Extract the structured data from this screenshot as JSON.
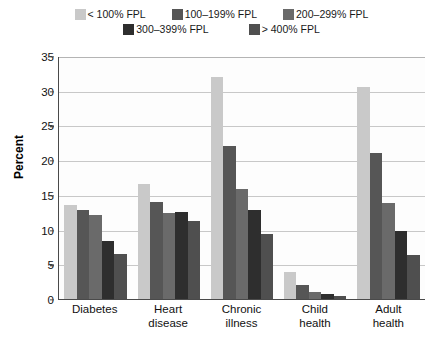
{
  "chart_data": {
    "type": "bar",
    "title": "",
    "xlabel": "",
    "ylabel": "Percent",
    "ylim": [
      0,
      35
    ],
    "yticks": [
      0,
      5,
      10,
      15,
      20,
      25,
      30,
      35
    ],
    "grid": true,
    "legend_position": "top",
    "categories": [
      "Diabetes",
      "Heart disease",
      "Chronic illness",
      "Child health",
      "Adult health"
    ],
    "category_lines": [
      [
        "Diabetes"
      ],
      [
        "Heart",
        "disease"
      ],
      [
        "Chronic",
        "illness"
      ],
      [
        "Child",
        "health"
      ],
      [
        "Adult",
        "health"
      ]
    ],
    "series": [
      {
        "name": "< 100% FPL",
        "color": "#c9c9c9",
        "values": [
          13.5,
          16.5,
          32.0,
          3.9,
          30.6
        ]
      },
      {
        "name": "100–199% FPL",
        "color": "#565656",
        "values": [
          12.8,
          14.0,
          22.0,
          2.0,
          21.0
        ]
      },
      {
        "name": "200–299% FPL",
        "color": "#6a6a6a",
        "values": [
          12.1,
          12.4,
          15.8,
          1.0,
          13.8
        ]
      },
      {
        "name": "300–399% FPL",
        "color": "#2e2e2e",
        "values": [
          8.3,
          12.5,
          12.8,
          0.7,
          9.8
        ]
      },
      {
        "name": "> 400% FPL",
        "color": "#4f4f4f",
        "values": [
          6.5,
          11.3,
          9.3,
          0.5,
          6.4
        ]
      }
    ]
  },
  "legend": {
    "row1": [
      "< 100% FPL",
      "100–199% FPL",
      "200–299% FPL"
    ],
    "row2": [
      "300–399% FPL",
      "> 400% FPL"
    ]
  },
  "axis": {
    "y_title": "Percent",
    "y_tick_labels": [
      "35",
      "30",
      "25",
      "20",
      "15",
      "10",
      "5",
      "0"
    ]
  }
}
